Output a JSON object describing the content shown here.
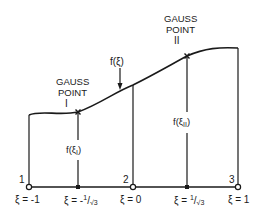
{
  "diagram": {
    "gauss_point_1": {
      "line1": "GAUSS",
      "line2": "POINT",
      "numeral": "I"
    },
    "gauss_point_2": {
      "line1": "GAUSS",
      "line2": "POINT",
      "numeral": "II"
    },
    "function_label": "f(ξ)",
    "f_xi_1": {
      "f": "f(ξ",
      "sub": "I",
      "close": ")"
    },
    "f_xi_2": {
      "f": "f(ξ",
      "sub": "II",
      "close": ")"
    },
    "nodes": [
      {
        "number": "1",
        "label": "ξ = -1"
      },
      {
        "number": "2",
        "label": "ξ = 0"
      },
      {
        "number": "3",
        "label": "ξ = 1"
      }
    ],
    "gauss_labels": [
      {
        "label_pre": "ξ = -",
        "num": "1",
        "den": "√3"
      },
      {
        "label_pre": "ξ = ",
        "num": "1",
        "den": "√3"
      }
    ]
  }
}
